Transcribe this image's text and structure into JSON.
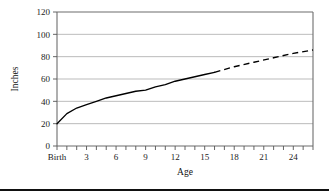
{
  "figure": {
    "caption_rule": "bottom-divider-rule"
  },
  "chart_data": {
    "type": "line",
    "title": "",
    "subtitle": "",
    "xlabel": "Age",
    "ylabel": "Inches",
    "xlim": [
      0,
      26
    ],
    "ylim": [
      0,
      120
    ],
    "grid": true,
    "legend": "none",
    "y_ticks": [
      0,
      20,
      40,
      60,
      80,
      100,
      120
    ],
    "y_tick_labels": [
      "0",
      "20",
      "40",
      "60",
      "80",
      "100",
      "120"
    ],
    "x_ticks": [
      0,
      1,
      2,
      3,
      4,
      5,
      6,
      7,
      8,
      9,
      10,
      11,
      12,
      13,
      14,
      15,
      16,
      17,
      18,
      19,
      20,
      21,
      22,
      23,
      24,
      25,
      26
    ],
    "x_labeled_ticks": [
      0,
      3,
      6,
      9,
      12,
      15,
      18,
      21,
      24
    ],
    "x_tick_labels": [
      "Birth",
      "3",
      "6",
      "9",
      "12",
      "15",
      "18",
      "21",
      "24"
    ],
    "series": [
      {
        "name": "Measured height",
        "style": "solid",
        "x": [
          0,
          1,
          2,
          3,
          4,
          5,
          6,
          7,
          8,
          9,
          10,
          11,
          12,
          13,
          14,
          15,
          16
        ],
        "values": [
          20,
          29,
          34,
          37,
          40,
          43,
          45,
          47,
          49,
          50,
          53,
          55,
          58,
          60,
          62,
          64,
          66
        ]
      },
      {
        "name": "Projected height",
        "style": "dashed",
        "x": [
          16,
          18,
          20,
          22,
          24,
          26
        ],
        "values": [
          66,
          71,
          75,
          79,
          83,
          86
        ]
      }
    ]
  }
}
